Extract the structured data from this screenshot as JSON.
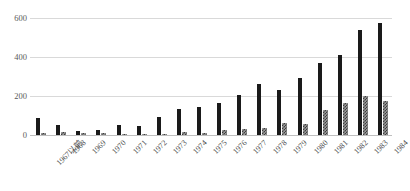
{
  "chart_data": {
    "type": "bar",
    "title": "",
    "subtitle": "",
    "xlabel": "",
    "ylabel": "",
    "ylim": [
      0,
      600
    ],
    "yticks": [
      0,
      200,
      400,
      600
    ],
    "ytick_labels": [
      "0",
      "200",
      "400",
      "600"
    ],
    "grid": "horizontal",
    "legend": "none",
    "orientation": "vertical",
    "categories": [
      "1967以前",
      "1968",
      "1969",
      "1970",
      "1971",
      "1972",
      "1973",
      "1974",
      "1975",
      "1976",
      "1977",
      "1978",
      "1979",
      "1980",
      "1981",
      "1982",
      "1983",
      "1984"
    ],
    "series": [
      {
        "name": "series-1",
        "style": "solid-black",
        "color": "#1a1a1a",
        "values": [
          88,
          52,
          22,
          27,
          50,
          45,
          92,
          135,
          145,
          165,
          205,
          262,
          232,
          290,
          370,
          412,
          537,
          572
        ]
      },
      {
        "name": "series-2",
        "style": "checkered-gray",
        "color": "#9a9a9a",
        "values": [
          10,
          14,
          8,
          10,
          5,
          5,
          6,
          13,
          8,
          28,
          32,
          36,
          60,
          58,
          130,
          165,
          202,
          172
        ]
      }
    ],
    "colors": {
      "gridline": "#d9d9d9",
      "baseline": "#bfbfbf",
      "tick_text": "#595959",
      "category_text": "#4a4a4a",
      "background": "#ffffff"
    }
  }
}
